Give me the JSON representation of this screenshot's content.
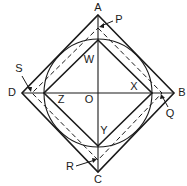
{
  "diagram": {
    "title": "",
    "colors": {
      "stroke": "#1a1a1a",
      "background": "#ffffff"
    },
    "center": {
      "name": "O",
      "x": 98,
      "y": 93
    },
    "outer_square": {
      "vertices": [
        {
          "name": "A",
          "x": 98,
          "y": 15
        },
        {
          "name": "B",
          "x": 174,
          "y": 93
        },
        {
          "name": "C",
          "x": 98,
          "y": 172
        },
        {
          "name": "D",
          "x": 22,
          "y": 93
        }
      ]
    },
    "inner_square": {
      "vertices": [
        {
          "x": 98,
          "y": 40
        },
        {
          "x": 152,
          "y": 93
        },
        {
          "x": 98,
          "y": 146
        },
        {
          "x": 44,
          "y": 93
        }
      ]
    },
    "circle": {
      "cx": 98,
      "cy": 93,
      "r": 54
    },
    "dashed_square": {
      "vertices": [
        {
          "x": 98,
          "y": 28
        },
        {
          "x": 162,
          "y": 93
        },
        {
          "x": 98,
          "y": 160
        },
        {
          "x": 32,
          "y": 93
        }
      ]
    },
    "labels": {
      "A": "A",
      "B": "B",
      "C": "C",
      "D": "D",
      "O": "O",
      "P": "P",
      "Q": "Q",
      "R": "R",
      "S": "S",
      "W": "W",
      "X": "X",
      "Y": "Y",
      "Z": "Z"
    }
  }
}
